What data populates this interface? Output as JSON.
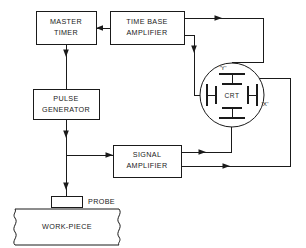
{
  "diagram": {
    "blocks": [
      {
        "id": "master_timer",
        "line1": "MASTER",
        "line2": "TIMER"
      },
      {
        "id": "time_base_amp",
        "line1": "TIME BASE",
        "line2": "AMPLIFIER"
      },
      {
        "id": "pulse_generator",
        "line1": "PULSE",
        "line2": "GENERATOR"
      },
      {
        "id": "signal_amp",
        "line1": "SIGNAL",
        "line2": "AMPLIFIER"
      }
    ],
    "crt": {
      "label": "CRT",
      "y_plate_label": "'Y'",
      "x_plate_label": "'X'"
    },
    "probe": {
      "label": "PROBE"
    },
    "workpiece": {
      "label": "WORK-PIECE"
    },
    "colors": {
      "line": "#1a1a1a",
      "background": "#ffffff",
      "box_fill": "#ffffff"
    }
  }
}
